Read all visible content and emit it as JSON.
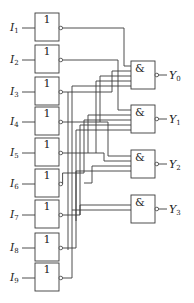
{
  "diagram": {
    "title": "",
    "inverters": [
      {
        "input": "I",
        "sub": "1",
        "symbol": "1",
        "y": 13
      },
      {
        "input": "I",
        "sub": "2",
        "symbol": "1",
        "y": 45
      },
      {
        "input": "I",
        "sub": "3",
        "symbol": "1",
        "y": 77
      },
      {
        "input": "I",
        "sub": "4",
        "symbol": "1",
        "y": 107
      },
      {
        "input": "I",
        "sub": "5",
        "symbol": "1",
        "y": 138
      },
      {
        "input": "I",
        "sub": "6",
        "symbol": "1",
        "y": 169
      },
      {
        "input": "I",
        "sub": "7",
        "symbol": "1",
        "y": 200
      },
      {
        "input": "I",
        "sub": "8",
        "symbol": "1",
        "y": 233
      },
      {
        "input": "I",
        "sub": "9",
        "symbol": "1",
        "y": 263
      }
    ],
    "nand_gates": [
      {
        "output": "Y",
        "sub": "0",
        "symbol": "&",
        "y": 61
      },
      {
        "output": "Y",
        "sub": "1",
        "symbol": "&",
        "y": 105
      },
      {
        "output": "Y",
        "sub": "2",
        "symbol": "&",
        "y": 150
      },
      {
        "output": "Y",
        "sub": "3",
        "symbol": "&",
        "y": 195
      }
    ],
    "gate_type_input": "NOT (inverter)",
    "gate_type_output": "NAND"
  }
}
